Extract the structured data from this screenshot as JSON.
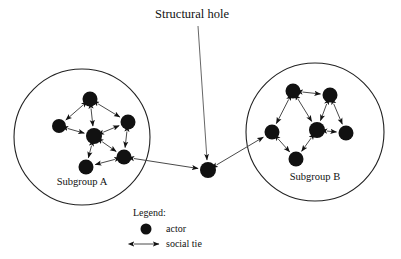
{
  "figure": {
    "title": "Structural hole",
    "type": "social-network-diagram",
    "background_color": "#ffffff",
    "node_color": "#111111",
    "edge_color": "#4a4a4a",
    "circle_color": "#222222"
  },
  "annotation": {
    "label": "Structural hole",
    "label_x": 155,
    "label_y": 18,
    "leader_from_x": 198,
    "leader_from_y": 26,
    "leader_to_x": 207,
    "leader_to_y": 160
  },
  "subgroups": [
    {
      "id": "A",
      "label": "Subgroup A",
      "label_x": 82,
      "label_y": 185,
      "circle_cx": 82,
      "circle_cy": 137,
      "circle_r": 68,
      "nodes": [
        {
          "id": "a1",
          "x": 90,
          "y": 99,
          "r": 7.5
        },
        {
          "id": "a2",
          "x": 59,
          "y": 126,
          "r": 7.0
        },
        {
          "id": "a3",
          "x": 94,
          "y": 136,
          "r": 8.0
        },
        {
          "id": "a4",
          "x": 128,
          "y": 122,
          "r": 7.5
        },
        {
          "id": "a5",
          "x": 124,
          "y": 157,
          "r": 7.5
        },
        {
          "id": "a6",
          "x": 86,
          "y": 167,
          "r": 7.5
        }
      ],
      "edges": [
        {
          "from": "a1",
          "to": "a2",
          "arrows": "both"
        },
        {
          "from": "a1",
          "to": "a3",
          "arrows": "both"
        },
        {
          "from": "a1",
          "to": "a4",
          "arrows": "both"
        },
        {
          "from": "a2",
          "to": "a3",
          "arrows": "both"
        },
        {
          "from": "a3",
          "to": "a4",
          "arrows": "both"
        },
        {
          "from": "a3",
          "to": "a5",
          "arrows": "both"
        },
        {
          "from": "a3",
          "to": "a6",
          "arrows": "both"
        },
        {
          "from": "a4",
          "to": "a5",
          "arrows": "both"
        },
        {
          "from": "a5",
          "to": "a6",
          "arrows": "both"
        }
      ]
    },
    {
      "id": "B",
      "label": "Subgroup B",
      "label_x": 315,
      "label_y": 180,
      "circle_cx": 315,
      "circle_cy": 132,
      "circle_r": 69,
      "nodes": [
        {
          "id": "b1",
          "x": 293,
          "y": 91,
          "r": 7.5
        },
        {
          "id": "b2",
          "x": 330,
          "y": 95,
          "r": 7.5
        },
        {
          "id": "b3",
          "x": 272,
          "y": 132,
          "r": 7.5
        },
        {
          "id": "b4",
          "x": 317,
          "y": 130,
          "r": 8.0
        },
        {
          "id": "b5",
          "x": 346,
          "y": 133,
          "r": 7.5
        },
        {
          "id": "b6",
          "x": 296,
          "y": 159,
          "r": 7.5
        }
      ],
      "edges": [
        {
          "from": "b1",
          "to": "b2",
          "arrows": "both"
        },
        {
          "from": "b1",
          "to": "b3",
          "arrows": "both"
        },
        {
          "from": "b1",
          "to": "b4",
          "arrows": "both"
        },
        {
          "from": "b2",
          "to": "b4",
          "arrows": "both"
        },
        {
          "from": "b2",
          "to": "b5",
          "arrows": "both"
        },
        {
          "from": "b4",
          "to": "b5",
          "arrows": "both"
        },
        {
          "from": "b4",
          "to": "b6",
          "arrows": "both"
        },
        {
          "from": "b3",
          "to": "b6",
          "arrows": "both"
        }
      ]
    }
  ],
  "bridge_node": {
    "id": "h1",
    "x": 208,
    "y": 170,
    "r": 8.0
  },
  "bridge_edges": [
    {
      "from_x": 124,
      "to_x": 208,
      "from_y": 157,
      "to_y": 170,
      "arrows": "both"
    },
    {
      "from_x": 208,
      "to_x": 272,
      "from_y": 170,
      "to_y": 132,
      "arrows": "both"
    }
  ],
  "legend": {
    "title": "Legend:",
    "title_x": 133,
    "title_y": 216,
    "items": [
      {
        "symbol": "filled-circle",
        "label": "actor",
        "label_x": 166,
        "label_y": 232,
        "symbol_x": 146,
        "symbol_y": 229
      },
      {
        "symbol": "double-arrow",
        "label": "social tie",
        "label_x": 166,
        "label_y": 247,
        "symbol_x": 146,
        "symbol_y": 244
      }
    ]
  }
}
